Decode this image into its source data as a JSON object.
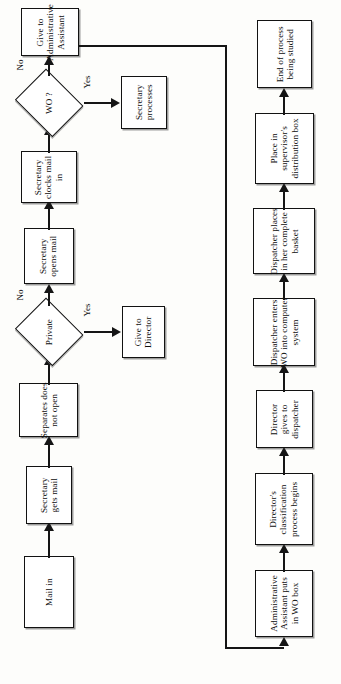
{
  "diagram": {
    "orientation": "rotated-90-ccw",
    "colors": {
      "stroke": "#151515",
      "fill": "#ffffff",
      "background": "#fdfdfb"
    },
    "nodes": [
      {
        "id": "mail-in",
        "type": "process",
        "label": "Mail in"
      },
      {
        "id": "secretary-gets-mail",
        "type": "process",
        "label": "Secretary\ngets mail"
      },
      {
        "id": "separates",
        "type": "process",
        "label": "Separates does\nnot open"
      },
      {
        "id": "private",
        "type": "decision",
        "label": "Private"
      },
      {
        "id": "give-to-director",
        "type": "process",
        "label": "Give to\nDirector"
      },
      {
        "id": "secretary-opens",
        "type": "process",
        "label": "Secretary\nopens mail"
      },
      {
        "id": "secretary-clocks",
        "type": "process",
        "label": "Secretary\nclocks mail\nin"
      },
      {
        "id": "wo",
        "type": "decision",
        "label": "WO ?"
      },
      {
        "id": "secretary-processes",
        "type": "process",
        "label": "Secretary\nprocesses"
      },
      {
        "id": "give-to-admin",
        "type": "process",
        "label": "Give to\nAdministrative\nAssistant"
      },
      {
        "id": "admin-puts-wo-box",
        "type": "process",
        "label": "Administrative\nAssistant puts\nin WO box"
      },
      {
        "id": "director-classify",
        "type": "process",
        "label": "Director's\nclassification\nprocess begins"
      },
      {
        "id": "director-gives",
        "type": "process",
        "label": "Director\ngives to\ndispatcher"
      },
      {
        "id": "dispatcher-enters",
        "type": "process",
        "label": "Dispatcher enters\nWO into computer\nsystem"
      },
      {
        "id": "dispatcher-basket",
        "type": "process",
        "label": "Dispatcher places\nin her complete\nbasket"
      },
      {
        "id": "place-supervisor",
        "type": "process",
        "label": "Place in\nsupervisor's\ndistribution box"
      },
      {
        "id": "end-of-process",
        "type": "process",
        "label": "End of process\nbeing studied"
      }
    ],
    "edge_labels": {
      "private_no": "No",
      "private_yes": "Yes",
      "wo_no": "No",
      "wo_yes": "Yes"
    },
    "edges": [
      {
        "from": "mail-in",
        "to": "secretary-gets-mail",
        "label": ""
      },
      {
        "from": "secretary-gets-mail",
        "to": "separates",
        "label": ""
      },
      {
        "from": "separates",
        "to": "private",
        "label": ""
      },
      {
        "from": "private",
        "to": "give-to-director",
        "label": "Yes"
      },
      {
        "from": "private",
        "to": "secretary-opens",
        "label": "No"
      },
      {
        "from": "secretary-opens",
        "to": "secretary-clocks",
        "label": ""
      },
      {
        "from": "secretary-clocks",
        "to": "wo",
        "label": ""
      },
      {
        "from": "wo",
        "to": "secretary-processes",
        "label": "Yes"
      },
      {
        "from": "wo",
        "to": "give-to-admin",
        "label": "No"
      },
      {
        "from": "give-to-admin",
        "to": "admin-puts-wo-box",
        "label": ""
      },
      {
        "from": "admin-puts-wo-box",
        "to": "director-classify",
        "label": ""
      },
      {
        "from": "director-classify",
        "to": "director-gives",
        "label": ""
      },
      {
        "from": "director-gives",
        "to": "dispatcher-enters",
        "label": ""
      },
      {
        "from": "dispatcher-enters",
        "to": "dispatcher-basket",
        "label": ""
      },
      {
        "from": "dispatcher-basket",
        "to": "place-supervisor",
        "label": ""
      },
      {
        "from": "place-supervisor",
        "to": "end-of-process",
        "label": ""
      }
    ]
  }
}
